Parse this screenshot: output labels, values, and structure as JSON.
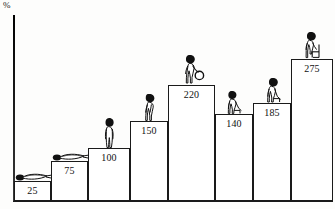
{
  "chart_data": {
    "type": "bar",
    "title": "",
    "subtitle": "",
    "xlabel": "",
    "ylabel": "%",
    "unit_label": "%",
    "categories": [
      "1",
      "2",
      "3",
      "4",
      "5",
      "6",
      "7",
      "8"
    ],
    "values": [
      25,
      75,
      100,
      150,
      220,
      140,
      185,
      275
    ],
    "value_labels": [
      "25",
      "75",
      "100",
      "150",
      "220",
      "140",
      "185",
      "275"
    ],
    "ylim": [
      0,
      300
    ],
    "grid": false,
    "legend": null,
    "annotations": [
      {
        "bar": 1,
        "icon": "person-lying-icon",
        "description": "person lying flat"
      },
      {
        "bar": 2,
        "icon": "person-lying-icon",
        "description": "person lying flat"
      },
      {
        "bar": 3,
        "icon": "person-standing-icon",
        "description": "person standing"
      },
      {
        "bar": 4,
        "icon": "person-bending-icon",
        "description": "person bending over"
      },
      {
        "bar": 5,
        "icon": "person-lifting-weight-icon",
        "description": "person lifting a weight"
      },
      {
        "bar": 6,
        "icon": "person-sitting-icon",
        "description": "person sitting"
      },
      {
        "bar": 7,
        "icon": "person-sitting-icon",
        "description": "person sitting"
      },
      {
        "bar": 8,
        "icon": "person-sitting-chair-icon",
        "description": "person sitting on a chair"
      }
    ]
  },
  "axis": {
    "unit": "%"
  },
  "bars": [
    {
      "label": "25",
      "left": 14,
      "width": 37,
      "height": 20,
      "figure": "lying"
    },
    {
      "label": "75",
      "left": 51,
      "width": 37,
      "height": 40,
      "figure": "lying"
    },
    {
      "label": "100",
      "left": 88,
      "width": 42,
      "height": 53,
      "figure": "standing"
    },
    {
      "label": "150",
      "left": 130,
      "width": 38,
      "height": 80,
      "figure": "bending"
    },
    {
      "label": "220",
      "left": 168,
      "width": 47,
      "height": 116,
      "figure": "lifting"
    },
    {
      "label": "140",
      "left": 215,
      "width": 38,
      "height": 87,
      "figure": "sitting"
    },
    {
      "label": "185",
      "left": 253,
      "width": 38,
      "height": 98,
      "figure": "sitting"
    },
    {
      "label": "275",
      "left": 291,
      "width": 42,
      "height": 142,
      "figure": "chair"
    }
  ],
  "colors": {
    "ink": "#1a1a1a",
    "paper": "#fdfdfc",
    "bar_fill": "#ffffff"
  }
}
